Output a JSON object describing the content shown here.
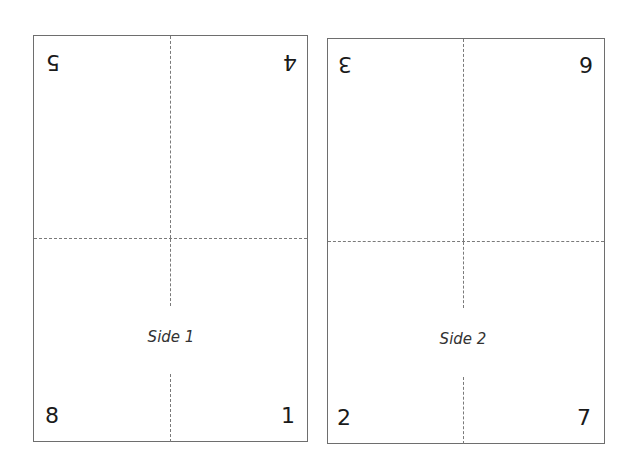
{
  "sheets": [
    {
      "label": "Side 1",
      "pages": {
        "top_left": "5",
        "top_right": "4",
        "bottom_left": "8",
        "bottom_right": "1"
      },
      "top_pages_rotated": true
    },
    {
      "label": "Side 2",
      "pages": {
        "top_left": "3",
        "top_right": "6",
        "bottom_left": "2",
        "bottom_right": "7"
      },
      "top_pages_rotated": true
    }
  ],
  "colors": {
    "border": "#6e6e6e",
    "fold_line": "#7a7a7a",
    "text": "#1a1a1a"
  }
}
